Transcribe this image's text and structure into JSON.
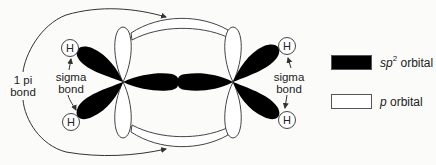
{
  "diagram": {
    "type": "molecular-orbital-diagram",
    "atoms": {
      "carbon_left": {
        "x": 123,
        "y": 82
      },
      "carbon_right": {
        "x": 233,
        "y": 82
      },
      "hydrogens": [
        {
          "id": "h-top-left",
          "label": "H",
          "x": 70,
          "y": 48
        },
        {
          "id": "h-bottom-left",
          "label": "H",
          "x": 71,
          "y": 122
        },
        {
          "id": "h-top-right",
          "label": "H",
          "x": 287,
          "y": 46
        },
        {
          "id": "h-bottom-right",
          "label": "H",
          "x": 287,
          "y": 120
        }
      ]
    },
    "labels": {
      "pi_bond_line1": "1 pi",
      "pi_bond_line2": "bond",
      "sigma_left_line1": "sigma",
      "sigma_left_line2": "bond",
      "sigma_right_line1": "sigma",
      "sigma_right_line2": "bond"
    },
    "colors": {
      "sp2_fill": "#000000",
      "p_fill": "#ffffff",
      "outline": "#444444",
      "background": "#fbfbfa"
    }
  },
  "legend": {
    "items": [
      {
        "swatch": "black",
        "prefix": "sp",
        "superscript": "2",
        "suffix": " orbital"
      },
      {
        "swatch": "white",
        "prefix": "p",
        "superscript": "",
        "suffix": " orbital"
      }
    ]
  }
}
